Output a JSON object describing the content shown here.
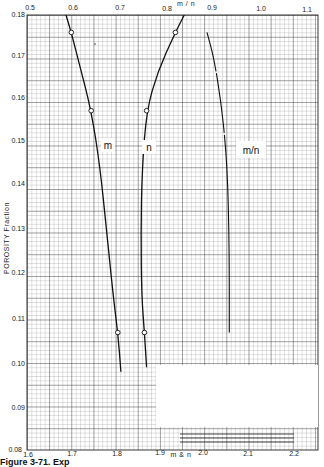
{
  "figure": {
    "caption": "Figure 3-71. Exp"
  },
  "chart_data": {
    "type": "line",
    "title": "",
    "ylabel": "POROSITY Fraction",
    "xlabel_bottom": "m & n",
    "xlabel_top": "m / n",
    "grid": true,
    "ylim": [
      0.08,
      0.18
    ],
    "xlim_bottom": [
      1.6,
      2.2
    ],
    "xlim_top": [
      0.5,
      1.1
    ],
    "y_ticks": [
      "0.18",
      "0.17",
      "0.16",
      "0.15",
      "0.14",
      "0.13",
      "0.12",
      "0.11",
      "0.10",
      "0.09",
      "0.08"
    ],
    "x_bottom_ticks": [
      "1.6",
      "1.7",
      "1.8",
      "1.9",
      "2.0",
      "2.1",
      "2.2"
    ],
    "x_top_ticks": [
      "0.5",
      "0.6",
      "0.7",
      "0.8",
      "0.9",
      "1.0",
      "1.1"
    ],
    "series": [
      {
        "name": "m",
        "axis": "bottom",
        "label": "m",
        "points": [
          [
            1.7,
            0.176
          ],
          [
            1.745,
            0.158
          ],
          [
            1.805,
            0.107
          ]
        ],
        "curve": [
          [
            1.688,
            0.18
          ],
          [
            1.7,
            0.176
          ],
          [
            1.72,
            0.168
          ],
          [
            1.745,
            0.158
          ],
          [
            1.765,
            0.145
          ],
          [
            1.78,
            0.13
          ],
          [
            1.795,
            0.115
          ],
          [
            1.805,
            0.107
          ],
          [
            1.812,
            0.098
          ]
        ]
      },
      {
        "name": "n",
        "axis": "bottom",
        "label": "n",
        "points": [
          [
            1.935,
            0.176
          ],
          [
            1.87,
            0.158
          ],
          [
            1.865,
            0.107
          ]
        ],
        "curve": [
          [
            1.955,
            0.18
          ],
          [
            1.935,
            0.176
          ],
          [
            1.895,
            0.167
          ],
          [
            1.87,
            0.158
          ],
          [
            1.86,
            0.145
          ],
          [
            1.857,
            0.13
          ],
          [
            1.859,
            0.115
          ],
          [
            1.865,
            0.107
          ],
          [
            1.87,
            0.099
          ]
        ]
      },
      {
        "name": "m/n",
        "axis": "top",
        "label": "m/n",
        "points": [],
        "curve": [
          [
            0.885,
            0.176
          ],
          [
            0.9,
            0.17
          ],
          [
            0.915,
            0.16
          ],
          [
            0.925,
            0.15
          ],
          [
            0.93,
            0.14
          ],
          [
            0.932,
            0.13
          ],
          [
            0.933,
            0.12
          ],
          [
            0.933,
            0.107
          ]
        ]
      }
    ],
    "legend": "none (blank white rectangle at lower right)"
  }
}
